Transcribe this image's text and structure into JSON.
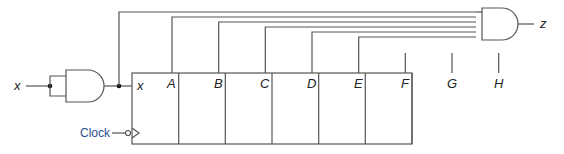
{
  "diagram": {
    "input_label": "x",
    "output_label": "z",
    "clock_label": "Clock",
    "register": {
      "serial_input_label": "x",
      "cells": [
        "A",
        "B",
        "C",
        "D",
        "E",
        "F",
        "G",
        "H"
      ]
    },
    "gates": [
      {
        "type": "AND",
        "inputs": "x tied to both inputs",
        "role": "input buffer"
      },
      {
        "type": "AND",
        "inputs": [
          "x",
          "A",
          "B",
          "C",
          "D",
          "E"
        ],
        "output": "z"
      }
    ],
    "colors": {
      "wire": "#555555",
      "text": "#222222",
      "clock_label": "#2a4d8f"
    }
  }
}
